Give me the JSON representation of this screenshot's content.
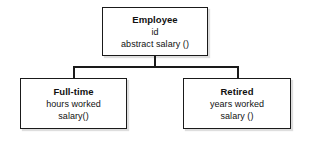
{
  "diagram": {
    "type": "uml-class-diagram",
    "relationship": "generalization",
    "background_color": "#ffffff",
    "line_color": "#1a1a1a",
    "box_fill": "#ffffff",
    "text_color": "#111111",
    "classes": [
      {
        "id": "employee",
        "role": "superclass",
        "name": "Employee",
        "members": [
          "id",
          "abstract salary ()"
        ]
      },
      {
        "id": "fulltime",
        "role": "subclass",
        "name": "Full-time",
        "members": [
          "hours worked",
          "salary()"
        ]
      },
      {
        "id": "retired",
        "role": "subclass",
        "name": "Retired",
        "members": [
          "years worked",
          "salary ()"
        ]
      }
    ],
    "connectors": [
      {
        "id": "stem",
        "from": "employee",
        "to": "branch-bar"
      },
      {
        "id": "drop-left",
        "from": "branch-bar",
        "to": "fulltime"
      },
      {
        "id": "drop-right",
        "from": "branch-bar",
        "to": "retired"
      }
    ]
  }
}
